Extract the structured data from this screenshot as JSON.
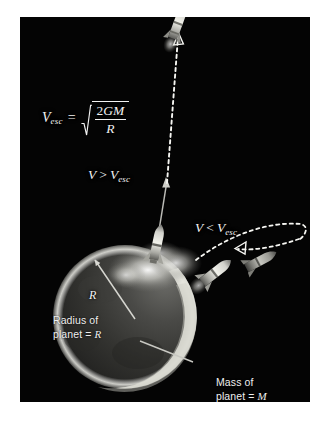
{
  "figure": {
    "domain_label": "escape-velocity-diagram",
    "plate": {
      "background_color": "#040404",
      "page_color": "#ffffff"
    }
  },
  "formula": {
    "lhs_var": "V",
    "lhs_subscript": "esc",
    "equals": "=",
    "radical_numerator_coefficient": "2",
    "radical_numerator_vars": "GM",
    "radical_denominator": "R",
    "plain_text": "V_esc = sqrt(2GM/R)"
  },
  "labels": {
    "escape_case": {
      "var": "V",
      "operator": ">",
      "compare_var": "V",
      "compare_subscript": "esc",
      "plain_text": "V > V_esc"
    },
    "suborbital_case": {
      "var": "V",
      "operator": "<",
      "compare_var": "V",
      "compare_subscript": "esc",
      "plain_text": "V < V_esc"
    },
    "radius_symbol": "R"
  },
  "captions": {
    "radius": {
      "line1": "Radius of",
      "line2_prefix": "planet = ",
      "line2_symbol": "R"
    },
    "mass": {
      "line1": "Mass of",
      "line2_prefix": "planet = ",
      "line2_symbol": "M"
    }
  },
  "objects": {
    "planet": {
      "name": "planet-sphere",
      "center_x": 105,
      "center_y": 300,
      "radius": 72,
      "body_color": "#2e2e2e",
      "limb_color": "#d8d8d0"
    },
    "rockets": [
      {
        "name": "rocket-escaping-top",
        "x": 176,
        "y": 26,
        "angle": -18
      },
      {
        "name": "rocket-launching",
        "x": 139,
        "y": 237,
        "angle": -22
      },
      {
        "name": "rocket-suborbital-ascending",
        "x": 196,
        "y": 256,
        "angle": -38
      },
      {
        "name": "rocket-suborbital-descending",
        "x": 240,
        "y": 245,
        "angle": -30
      }
    ],
    "trajectories": [
      {
        "name": "escape-trajectory",
        "style": "dashed",
        "direction": "upward-arrow"
      },
      {
        "name": "suborbital-trajectory",
        "style": "dashed",
        "direction": "arc-return-arrow"
      }
    ],
    "annotation_arrows": [
      {
        "name": "radius-arrow",
        "from": "planet-center",
        "to": "planet-surface"
      },
      {
        "name": "mass-pointer-line",
        "from": "caption-mass",
        "to": "planet-limb"
      }
    ]
  },
  "colors": {
    "text": "#f2f2f2",
    "trajectory": "#ffffff",
    "rocket_body": "#c9c9c4",
    "exhaust_plume": "#cfcfc9"
  }
}
